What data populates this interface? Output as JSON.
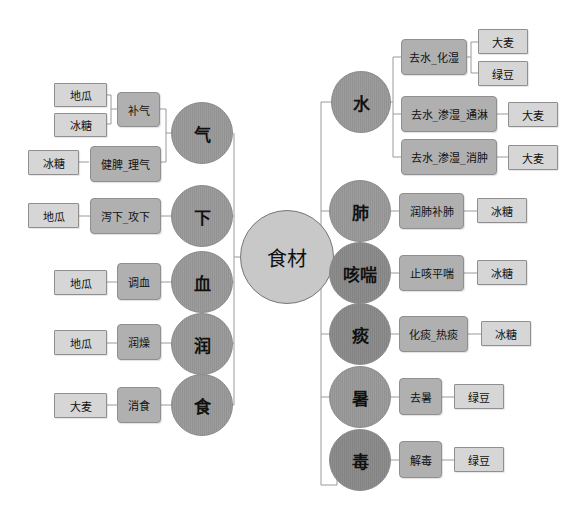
{
  "diagram": {
    "type": "mind-map",
    "center": {
      "label": "食材"
    },
    "colors": {
      "center_fill": "#c8c8c8",
      "category_fill": "#9a9a9a",
      "effect_fill": "#b0b0b0",
      "food_fill": "#d6d6d6",
      "line": "#9a9a9a"
    },
    "left_branches": [
      {
        "label": "气",
        "effects": [
          {
            "label": "补气",
            "foods": [
              "地瓜",
              "冰糖"
            ]
          },
          {
            "label": "健脾_理气",
            "foods": [
              "冰糖"
            ]
          }
        ]
      },
      {
        "label": "下",
        "effects": [
          {
            "label": "泻下_攻下",
            "foods": [
              "地瓜"
            ]
          }
        ]
      },
      {
        "label": "血",
        "effects": [
          {
            "label": "调血",
            "foods": [
              "地瓜"
            ]
          }
        ]
      },
      {
        "label": "润",
        "effects": [
          {
            "label": "润燥",
            "foods": [
              "地瓜"
            ]
          }
        ]
      },
      {
        "label": "食",
        "effects": [
          {
            "label": "消食",
            "foods": [
              "大麦"
            ]
          }
        ]
      }
    ],
    "right_branches": [
      {
        "label": "水",
        "effects": [
          {
            "label": "去水_化湿",
            "foods": [
              "大麦",
              "绿豆"
            ]
          },
          {
            "label": "去水_渗湿_通淋",
            "foods": [
              "大麦"
            ]
          },
          {
            "label": "去水_渗湿_消肿",
            "foods": [
              "大麦"
            ]
          }
        ]
      },
      {
        "label": "肺",
        "effects": [
          {
            "label": "润肺补肺",
            "foods": [
              "冰糖"
            ]
          }
        ]
      },
      {
        "label": "咳喘",
        "effects": [
          {
            "label": "止咳平喘",
            "foods": [
              "冰糖"
            ]
          }
        ]
      },
      {
        "label": "痰",
        "effects": [
          {
            "label": "化痰_热痰",
            "foods": [
              "冰糖"
            ]
          }
        ]
      },
      {
        "label": "暑",
        "effects": [
          {
            "label": "去暑",
            "foods": [
              "绿豆"
            ]
          }
        ]
      },
      {
        "label": "毒",
        "effects": [
          {
            "label": "解毒",
            "foods": [
              "绿豆"
            ]
          }
        ]
      }
    ]
  }
}
